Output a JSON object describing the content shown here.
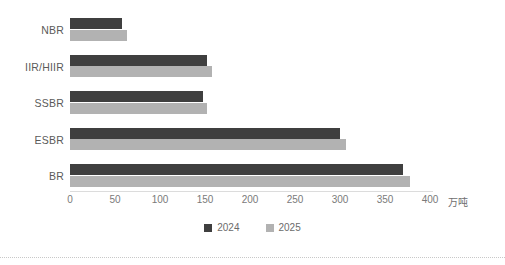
{
  "chart_data": {
    "type": "bar",
    "orientation": "horizontal",
    "title": "",
    "subtitle": "",
    "xlabel": "万吨",
    "ylabel": "",
    "categories": [
      "NBR",
      "IIR/HIIR",
      "SSBR",
      "ESBR",
      "BR"
    ],
    "series": [
      {
        "name": "2024",
        "color": "#3f3f3f",
        "values": [
          58,
          152,
          148,
          300,
          370
        ]
      },
      {
        "name": "2025",
        "color": "#b2b2b2",
        "values": [
          63,
          158,
          152,
          307,
          378
        ]
      }
    ],
    "xlim": [
      0,
      400
    ],
    "xticks": [
      0,
      50,
      100,
      150,
      200,
      250,
      300,
      350,
      400
    ],
    "xtick_labels": [
      "0",
      "50",
      "100",
      "150",
      "200",
      "250",
      "300",
      "350",
      "400"
    ],
    "unit_label": "万吨",
    "grid": false,
    "legend_position": "bottom",
    "legend_entries": [
      "2024",
      "2025"
    ]
  },
  "axis": {
    "unit": "万吨",
    "ticks": [
      "0",
      "50",
      "100",
      "150",
      "200",
      "250",
      "300",
      "350",
      "400"
    ]
  },
  "legend": {
    "items": [
      {
        "label": "2024",
        "color": "#3f3f3f"
      },
      {
        "label": "2025",
        "color": "#b2b2b2"
      }
    ]
  },
  "colors": {
    "series_2024": "#3f3f3f",
    "series_2025": "#b2b2b2",
    "axis_line": "#dcdcdc",
    "tick_text": "#7a7a7a",
    "category_text": "#5a5a5a",
    "background": "#ffffff"
  }
}
